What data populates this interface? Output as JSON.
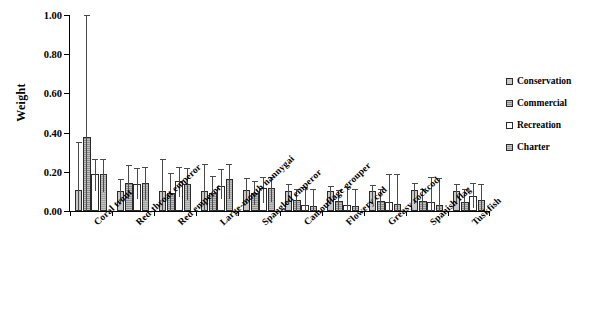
{
  "chart_data": {
    "type": "bar",
    "title": "",
    "xlabel": "",
    "ylabel": "Weight",
    "ylim": [
      0,
      1.0
    ],
    "yticks": [
      "0.00",
      "0.20",
      "0.40",
      "0.60",
      "0.80",
      "1.00"
    ],
    "ytick_values": [
      0,
      0.2,
      0.4,
      0.6,
      0.8,
      1.0
    ],
    "grid": false,
    "legend_position": "right",
    "error_bars": true,
    "categories": [
      "Coral trout",
      "Red-throat emperor",
      "Red emperor",
      "Large-mouth nannygai",
      "Spangled emperor",
      "Camouflage grouper",
      "Flowery cod",
      "Greasy rockcod",
      "Spanish flag",
      "Tuskfish"
    ],
    "series": [
      {
        "name": "Conservation",
        "color": "#c9c9c9",
        "values": [
          0.105,
          0.102,
          0.1,
          0.1,
          0.105,
          0.1,
          0.1,
          0.1,
          0.105,
          0.1
        ],
        "err_low": [
          0.105,
          0.06,
          0.1,
          0.1,
          0.07,
          0.065,
          0.065,
          0.065,
          0.07,
          0.065
        ],
        "err_high": [
          0.245,
          0.06,
          0.165,
          0.14,
          0.065,
          0.04,
          0.03,
          0.035,
          0.04,
          0.04
        ]
      },
      {
        "name": "Commercial",
        "color": "#8f8f8f",
        "values": [
          0.378,
          0.145,
          0.09,
          0.09,
          0.09,
          0.055,
          0.05,
          0.05,
          0.05,
          0.045
        ],
        "err_low": [
          0.378,
          0.085,
          0.09,
          0.09,
          0.06,
          0.055,
          0.05,
          0.05,
          0.05,
          0.045
        ],
        "err_high": [
          0.622,
          0.09,
          0.105,
          0.09,
          0.065,
          0.055,
          0.055,
          0.06,
          0.06,
          0.065
        ]
      },
      {
        "name": "Recreation",
        "color": "#ffffff",
        "values": [
          0.19,
          0.14,
          0.155,
          0.13,
          0.115,
          0.03,
          0.03,
          0.045,
          0.045,
          0.075
        ],
        "err_low": [
          0.09,
          0.08,
          0.085,
          0.07,
          0.075,
          0.03,
          0.03,
          0.045,
          0.045,
          0.06
        ],
        "err_high": [
          0.075,
          0.08,
          0.07,
          0.085,
          0.06,
          0.095,
          0.09,
          0.145,
          0.13,
          0.07
        ]
      },
      {
        "name": "Charter",
        "color": "#a3a3a3",
        "values": [
          0.19,
          0.145,
          0.14,
          0.165,
          0.115,
          0.025,
          0.025,
          0.035,
          0.03,
          0.055
        ],
        "err_low": [
          0.095,
          0.09,
          0.085,
          0.105,
          0.07,
          0.025,
          0.025,
          0.035,
          0.03,
          0.055
        ],
        "err_high": [
          0.075,
          0.08,
          0.08,
          0.075,
          0.06,
          0.085,
          0.085,
          0.155,
          0.14,
          0.085
        ]
      }
    ]
  }
}
